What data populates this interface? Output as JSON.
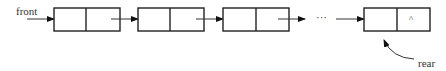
{
  "diagram": {
    "type": "singly-linked-list-queue",
    "labels": {
      "front": "front",
      "rear": "rear",
      "ellipsis": "···",
      "null_marker": "^"
    },
    "nodes": [
      {
        "id": "node-1",
        "data": "",
        "next": "node-2"
      },
      {
        "id": "node-2",
        "data": "",
        "next": "node-3"
      },
      {
        "id": "node-3",
        "data": "",
        "next": "..."
      },
      {
        "id": "node-4",
        "data": "",
        "next": "^"
      }
    ],
    "pointers": [
      {
        "name": "front",
        "points_to": "node-1"
      },
      {
        "name": "rear",
        "points_to": "node-4"
      }
    ],
    "colors": {
      "stroke": "#222222",
      "text": "#333333",
      "background": "#ffffff"
    }
  }
}
